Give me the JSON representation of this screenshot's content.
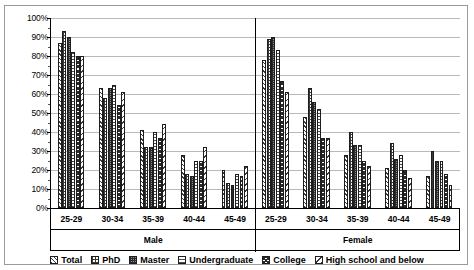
{
  "chart_data": {
    "type": "bar",
    "title": "",
    "subtitle": "",
    "xlabel": "",
    "ylabel": "",
    "ylim": [
      0,
      100
    ],
    "y_tick_labels": [
      "100%",
      "90%",
      "80%",
      "70%",
      "60%",
      "50%",
      "40%",
      "30%",
      "20%",
      "10%",
      "0%"
    ],
    "y_tick_values": [
      100,
      90,
      80,
      70,
      60,
      50,
      40,
      30,
      20,
      10,
      0
    ],
    "y_unit": "%",
    "grid": true,
    "legend_position": "bottom",
    "group_axis_label_outer": [
      "Male",
      "Female"
    ],
    "categories": [
      "25-29",
      "30-34",
      "35-39",
      "40-44",
      "45-49",
      "25-29",
      "30-34",
      "35-39",
      "40-44",
      "45-49"
    ],
    "panels": [
      {
        "name": "Male",
        "categories": [
          "25-29",
          "30-34",
          "35-39",
          "40-44",
          "45-49"
        ]
      },
      {
        "name": "Female",
        "categories": [
          "25-29",
          "30-34",
          "35-39",
          "40-44",
          "45-49"
        ]
      }
    ],
    "series": [
      {
        "name": "Total",
        "pattern": "pat-total",
        "values": [
          87,
          63,
          41,
          28,
          20,
          78,
          48,
          28,
          21,
          17
        ]
      },
      {
        "name": "PhD",
        "pattern": "pat-phd",
        "values": [
          93,
          58,
          32,
          18,
          13,
          89,
          63,
          40,
          34,
          30
        ]
      },
      {
        "name": "Master",
        "pattern": "pat-master",
        "values": [
          90,
          63,
          32,
          17,
          12,
          90,
          56,
          33,
          26,
          25
        ]
      },
      {
        "name": "Undergraduate",
        "pattern": "pat-undergraduate",
        "values": [
          82,
          65,
          40,
          25,
          18,
          83,
          52,
          33,
          28,
          25
        ]
      },
      {
        "name": "College",
        "pattern": "pat-college",
        "values": [
          80,
          54,
          37,
          25,
          17,
          67,
          37,
          25,
          20,
          18
        ]
      },
      {
        "name": "High school and below",
        "pattern": "pat-highschool",
        "values": [
          80,
          61,
          44,
          32,
          22,
          61,
          37,
          22,
          16,
          12
        ]
      }
    ]
  },
  "legend": {
    "items": [
      {
        "label": "Total",
        "pattern": "pat-total"
      },
      {
        "label": "PhD",
        "pattern": "pat-phd"
      },
      {
        "label": "Master",
        "pattern": "pat-master"
      },
      {
        "label": "Undergraduate",
        "pattern": "pat-undergraduate"
      },
      {
        "label": "College",
        "pattern": "pat-college"
      },
      {
        "label": "High school and below",
        "pattern": "pat-highschool"
      }
    ]
  }
}
